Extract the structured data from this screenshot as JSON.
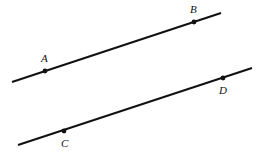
{
  "diagram": {
    "type": "geometry-parallel-lines",
    "stroke_color": "#111111",
    "background": "#ffffff",
    "lines": [
      {
        "id": "line-ab",
        "x1": 12,
        "y1": 82,
        "x2": 221,
        "y2": 13,
        "points": [
          {
            "label": "A",
            "x": 45,
            "y": 71,
            "label_x": 41,
            "label_y": 62
          },
          {
            "label": "B",
            "x": 194,
            "y": 22,
            "label_x": 190,
            "label_y": 13
          }
        ]
      },
      {
        "id": "line-cd",
        "x1": 18,
        "y1": 145,
        "x2": 252,
        "y2": 68,
        "points": [
          {
            "label": "C",
            "x": 64,
            "y": 131,
            "label_x": 61,
            "label_y": 147
          },
          {
            "label": "D",
            "x": 223,
            "y": 78,
            "label_x": 219,
            "label_y": 94
          }
        ]
      }
    ]
  },
  "labels": {
    "a": "A",
    "b": "B",
    "c": "C",
    "d": "D"
  }
}
